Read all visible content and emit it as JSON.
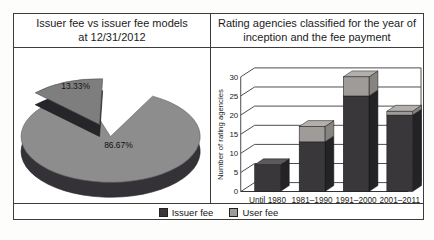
{
  "left_panel": {
    "title_line1": "Issuer fee vs issuer fee models",
    "title_line2": "at 12/31/2012"
  },
  "right_panel": {
    "title_line1": "Rating agencies classified for the year of",
    "title_line2": "inception and the fee payment",
    "ylabel": "Number of rating agencies"
  },
  "legend": {
    "items": [
      {
        "label": "Issuer fee",
        "color": "#39373a"
      },
      {
        "label": "User fee",
        "color": "#9e9b98"
      }
    ]
  },
  "colors": {
    "pie_large_top": "#8d8d8d",
    "pie_large_side": "#343237",
    "pie_small_top": "#7e7e7e",
    "pie_small_side": "#26252a",
    "issuer_front": "#39373a",
    "issuer_side": "#232225",
    "issuer_top": "#5b595c",
    "user_front": "#9e9b98",
    "user_side": "#868380",
    "user_top": "#b3b0ac",
    "grid_line": "#4d4d4d",
    "text": "#1b1b1b"
  },
  "chart_data": [
    {
      "type": "pie",
      "title": "Issuer fee vs issuer fee models at 12/31/2012",
      "labels": [
        "Issuer fee",
        "User fee"
      ],
      "values": [
        86.67,
        13.33
      ],
      "value_labels": [
        "86.67%",
        "13.33%"
      ],
      "unit": "%",
      "exploded_slice": "User fee",
      "style": "3d-pie"
    },
    {
      "type": "bar",
      "subtype": "stacked-3d-column",
      "title": "Rating agencies classified for the year of inception and the fee payment",
      "categories": [
        "Until 1980",
        "1981–1990",
        "1991–2000",
        "2001–2011"
      ],
      "series": [
        {
          "name": "Issuer fee",
          "values": [
            7,
            13,
            25,
            20
          ]
        },
        {
          "name": "User fee",
          "values": [
            0,
            4,
            5,
            1
          ]
        }
      ],
      "totals": [
        7,
        17,
        30,
        21
      ],
      "xlabel": "",
      "ylabel": "Number of rating agencies",
      "ylim": [
        0,
        30
      ],
      "yticks": [
        0,
        5,
        10,
        15,
        20,
        25,
        30
      ],
      "grid": true,
      "legend_position": "bottom"
    }
  ]
}
